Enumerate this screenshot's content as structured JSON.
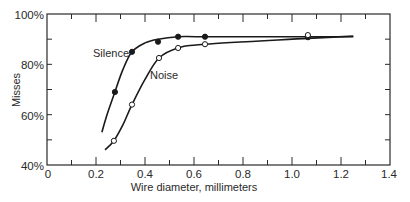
{
  "chart_data": {
    "type": "line",
    "title": "",
    "xlabel": "Wire diameter, millimeters",
    "ylabel": "Misses",
    "xlim": [
      0,
      1.4
    ],
    "ylim": [
      40,
      100
    ],
    "x_ticks": [
      0,
      0.2,
      0.4,
      0.6,
      0.8,
      1.0,
      1.2,
      1.4
    ],
    "x_tick_labels": [
      "0",
      "0.2",
      "0.4",
      "0.6",
      "0.8",
      "1.0",
      "1.2",
      "1.4"
    ],
    "x_minor_ticks": [
      0.1,
      0.3,
      0.5,
      0.7,
      0.9,
      1.1,
      1.3
    ],
    "y_ticks": [
      40,
      60,
      80,
      100
    ],
    "y_tick_labels": [
      "40%",
      "60%",
      "80%",
      "100%"
    ],
    "y_minor_ticks": [
      50,
      70,
      90
    ],
    "grid": false,
    "legend": "inline labels",
    "series": [
      {
        "name": "Silence",
        "marker": "filled circle",
        "points": [
          {
            "x": 0.277,
            "y": 69
          },
          {
            "x": 0.347,
            "y": 85
          },
          {
            "x": 0.453,
            "y": 89
          },
          {
            "x": 0.535,
            "y": 91
          },
          {
            "x": 0.645,
            "y": 91
          },
          {
            "x": 1.065,
            "y": 90.8
          }
        ],
        "curve": [
          [
            0.224,
            53
          ],
          [
            0.245,
            60
          ],
          [
            0.277,
            69
          ],
          [
            0.31,
            78
          ],
          [
            0.347,
            85
          ],
          [
            0.4,
            88.5
          ],
          [
            0.453,
            90
          ],
          [
            0.535,
            91
          ],
          [
            0.645,
            91
          ],
          [
            1.065,
            91
          ],
          [
            1.25,
            91
          ]
        ]
      },
      {
        "name": "Noise",
        "marker": "open circle",
        "points": [
          {
            "x": 0.273,
            "y": 49.6
          },
          {
            "x": 0.347,
            "y": 64
          },
          {
            "x": 0.457,
            "y": 82.5
          },
          {
            "x": 0.535,
            "y": 86.5
          },
          {
            "x": 0.645,
            "y": 88
          },
          {
            "x": 1.065,
            "y": 91.6
          }
        ],
        "curve": [
          [
            0.237,
            46
          ],
          [
            0.273,
            49.6
          ],
          [
            0.31,
            56
          ],
          [
            0.347,
            64
          ],
          [
            0.4,
            74
          ],
          [
            0.457,
            82.5
          ],
          [
            0.535,
            86.5
          ],
          [
            0.645,
            88
          ],
          [
            1.065,
            90.3
          ],
          [
            1.25,
            91.2
          ]
        ]
      }
    ],
    "annotations": [
      {
        "text": "Silence",
        "x": 0.24,
        "y": 84
      },
      {
        "text": "Noise",
        "x": 0.41,
        "y": 79
      }
    ]
  },
  "labels": {
    "xlabel": "Wire diameter, millimeters",
    "ylabel": "Misses",
    "silence": "Silence",
    "noise": "Noise",
    "y100": "100%",
    "y80": "80%",
    "y60": "60%",
    "y40": "40%",
    "x0": "0",
    "x02": "0.2",
    "x04": "0.4",
    "x06": "0.6",
    "x08": "0.8",
    "x10": "1.0",
    "x12": "1.2",
    "x14": "1.4"
  },
  "colors": {
    "line": "#1a1a1a",
    "axis": "#2a2a2a",
    "background": "#ffffff"
  }
}
